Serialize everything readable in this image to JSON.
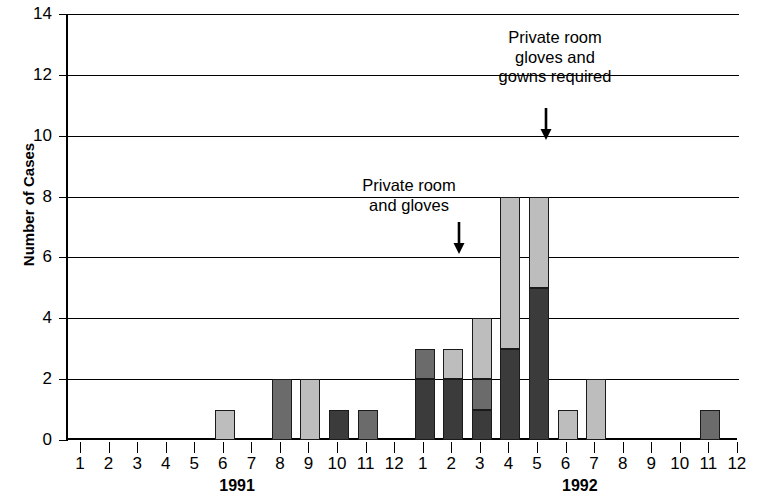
{
  "chart_data": {
    "type": "bar",
    "title": "",
    "subtitle": "",
    "xlabel": "",
    "ylabel": "Number of Cases",
    "ylim": [
      0,
      14
    ],
    "ytick_step": 2,
    "yticks": [
      0,
      2,
      4,
      6,
      8,
      10,
      12,
      14
    ],
    "grid": true,
    "stacked": true,
    "legend": null,
    "x_tick_labels": [
      "1",
      "2",
      "3",
      "4",
      "5",
      "6",
      "7",
      "8",
      "9",
      "10",
      "11",
      "12",
      "1",
      "2",
      "3",
      "4",
      "5",
      "6",
      "7",
      "8",
      "9",
      "10",
      "11",
      "12"
    ],
    "x_group_labels": [
      {
        "label": "1991",
        "first_tick_index": 0,
        "last_tick_index": 11
      },
      {
        "label": "1992",
        "first_tick_index": 12,
        "last_tick_index": 23
      }
    ],
    "series": [
      {
        "name": "dark-shade",
        "color": "#3b3b3b"
      },
      {
        "name": "medium-shade",
        "color": "#6b6b6b"
      },
      {
        "name": "light-shade",
        "color": "#bdbdbd"
      }
    ],
    "bars": [
      {
        "tick_index": 0,
        "year": "1991",
        "month": "1",
        "total": 0,
        "segments": []
      },
      {
        "tick_index": 1,
        "year": "1991",
        "month": "2",
        "total": 0,
        "segments": []
      },
      {
        "tick_index": 2,
        "year": "1991",
        "month": "3",
        "total": 0,
        "segments": []
      },
      {
        "tick_index": 3,
        "year": "1991",
        "month": "4",
        "total": 0,
        "segments": []
      },
      {
        "tick_index": 4,
        "year": "1991",
        "month": "5",
        "total": 0,
        "segments": []
      },
      {
        "tick_index": 5,
        "year": "1991",
        "month": "6",
        "total": 1,
        "segments": [
          {
            "from": 0,
            "to": 1,
            "shade": "light"
          }
        ]
      },
      {
        "tick_index": 6,
        "year": "1991",
        "month": "7",
        "total": 0,
        "segments": []
      },
      {
        "tick_index": 7,
        "year": "1991",
        "month": "8",
        "total": 2,
        "segments": [
          {
            "from": 0,
            "to": 2,
            "shade": "medium"
          }
        ]
      },
      {
        "tick_index": 8,
        "year": "1991",
        "month": "9",
        "total": 2,
        "segments": [
          {
            "from": 0,
            "to": 2,
            "shade": "light"
          }
        ]
      },
      {
        "tick_index": 9,
        "year": "1991",
        "month": "10",
        "total": 1,
        "segments": [
          {
            "from": 0,
            "to": 1,
            "shade": "dark"
          }
        ]
      },
      {
        "tick_index": 10,
        "year": "1991",
        "month": "11",
        "total": 1,
        "segments": [
          {
            "from": 0,
            "to": 1,
            "shade": "medium"
          }
        ]
      },
      {
        "tick_index": 11,
        "year": "1991",
        "month": "12",
        "total": 0,
        "segments": []
      },
      {
        "tick_index": 12,
        "year": "1992",
        "month": "1",
        "total": 3,
        "segments": [
          {
            "from": 0,
            "to": 2,
            "shade": "dark"
          },
          {
            "from": 2,
            "to": 3,
            "shade": "medium"
          }
        ]
      },
      {
        "tick_index": 13,
        "year": "1992",
        "month": "2",
        "total": 3,
        "segments": [
          {
            "from": 0,
            "to": 2,
            "shade": "dark"
          },
          {
            "from": 2,
            "to": 3,
            "shade": "light"
          }
        ]
      },
      {
        "tick_index": 14,
        "year": "1992",
        "month": "3",
        "total": 4,
        "segments": [
          {
            "from": 0,
            "to": 1,
            "shade": "dark"
          },
          {
            "from": 1,
            "to": 2,
            "shade": "medium"
          },
          {
            "from": 2,
            "to": 4,
            "shade": "light"
          }
        ]
      },
      {
        "tick_index": 15,
        "year": "1992",
        "month": "4",
        "total": 8,
        "segments": [
          {
            "from": 0,
            "to": 3,
            "shade": "dark"
          },
          {
            "from": 3,
            "to": 8,
            "shade": "light"
          }
        ]
      },
      {
        "tick_index": 16,
        "year": "1992",
        "month": "5",
        "total": 8,
        "segments": [
          {
            "from": 0,
            "to": 5,
            "shade": "dark"
          },
          {
            "from": 5,
            "to": 8,
            "shade": "light"
          }
        ]
      },
      {
        "tick_index": 17,
        "year": "1992",
        "month": "6",
        "total": 1,
        "segments": [
          {
            "from": 0,
            "to": 1,
            "shade": "light"
          }
        ]
      },
      {
        "tick_index": 18,
        "year": "1992",
        "month": "7",
        "total": 2,
        "segments": [
          {
            "from": 0,
            "to": 2,
            "shade": "light"
          }
        ]
      },
      {
        "tick_index": 19,
        "year": "1992",
        "month": "8",
        "total": 0,
        "segments": []
      },
      {
        "tick_index": 20,
        "year": "1992",
        "month": "9",
        "total": 0,
        "segments": []
      },
      {
        "tick_index": 21,
        "year": "1992",
        "month": "10",
        "total": 0,
        "segments": []
      },
      {
        "tick_index": 22,
        "year": "1992",
        "month": "11",
        "total": 1,
        "segments": [
          {
            "from": 0,
            "to": 1,
            "shade": "medium"
          }
        ]
      },
      {
        "tick_index": 23,
        "year": "1992",
        "month": "12",
        "total": 0,
        "segments": []
      }
    ],
    "annotations": [
      {
        "name": "private-room-and-gloves",
        "text": "Private room\nand gloves",
        "lines": [
          "Private room",
          "and gloves"
        ],
        "arrow": "down",
        "points_at_tick_index": 13,
        "points_at_value": 6,
        "text_center_x": 409,
        "text_top_y": 176,
        "arrow_x": 459,
        "arrow_top_y": 222,
        "arrow_bottom_y": 254
      },
      {
        "name": "private-room-gloves-and-gowns-required",
        "text": "Private room\ngloves and\ngowns required",
        "lines": [
          "Private room",
          "gloves and",
          "gowns required"
        ],
        "arrow": "down",
        "points_at_tick_index": 16,
        "points_at_value": 10,
        "text_center_x": 555,
        "text_top_y": 28,
        "arrow_x": 546,
        "arrow_top_y": 108,
        "arrow_bottom_y": 140
      }
    ]
  },
  "colors": {
    "dark": "#3b3b3b",
    "medium": "#6b6b6b",
    "light": "#bdbdbd",
    "axis": "#000000",
    "grid": "#000000",
    "background": "#ffffff",
    "bar_outline": "#1a1a1a"
  }
}
